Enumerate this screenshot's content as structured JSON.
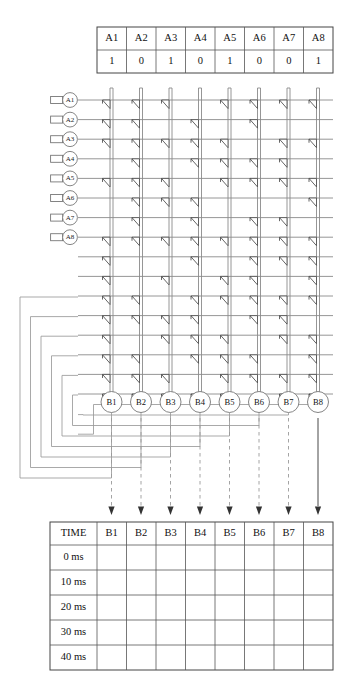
{
  "page": {
    "background_color": "#ffffff"
  },
  "input_table": {
    "name": "input-values-table",
    "headers": [
      "A1",
      "A2",
      "A3",
      "A4",
      "A5",
      "A6",
      "A7",
      "A8"
    ],
    "values": [
      "1",
      "0",
      "1",
      "0",
      "1",
      "0",
      "0",
      "1"
    ],
    "geometry": {
      "x": 97,
      "y": 27,
      "width": 236,
      "height": 46,
      "col_width": 29.5,
      "row_height": 23
    }
  },
  "input_nodes": {
    "name": "input-node-list",
    "labels": [
      "A1",
      "A2",
      "A3",
      "A4",
      "A5",
      "A6",
      "A7",
      "A8"
    ],
    "geometry": {
      "cx": 70,
      "cy_start": 100,
      "cy_step": 19.6,
      "r": 7.4,
      "tab_width": 12,
      "tab_height": 7
    }
  },
  "output_nodes": {
    "name": "output-node-list",
    "labels": [
      "B1",
      "B2",
      "B3",
      "B4",
      "B5",
      "B6",
      "B7",
      "B8"
    ],
    "geometry": {
      "cy": 402,
      "r": 10.5
    }
  },
  "columns": {
    "name": "vertical-bus-columns",
    "count": 8,
    "x_positions": [
      111.5,
      141.0,
      170.5,
      200.0,
      229.5,
      259.0,
      288.5,
      318.0
    ],
    "bus_gap": 3.0,
    "top_y": 88,
    "bottom_y": 392
  },
  "rows": {
    "name": "horizontal-signal-rows",
    "count": 16,
    "y_start": 100,
    "y_step": 19.6,
    "input_row_count": 8,
    "feedback_row_count": 8,
    "left_x": 78,
    "right_x": 333
  },
  "gate_matrix": {
    "name": "gate-connection-matrix",
    "description": "rows x columns; 1 = buffer gate present at intersection",
    "matrix": [
      [
        1,
        1,
        1,
        0,
        1,
        1,
        1,
        1
      ],
      [
        1,
        1,
        0,
        1,
        0,
        1,
        0,
        0
      ],
      [
        1,
        1,
        1,
        1,
        1,
        0,
        1,
        1
      ],
      [
        0,
        1,
        0,
        1,
        1,
        1,
        1,
        0
      ],
      [
        1,
        1,
        1,
        0,
        1,
        1,
        1,
        1
      ],
      [
        0,
        1,
        1,
        1,
        0,
        0,
        0,
        1
      ],
      [
        0,
        1,
        0,
        1,
        0,
        1,
        1,
        0
      ],
      [
        1,
        1,
        1,
        1,
        1,
        1,
        1,
        1
      ],
      [
        1,
        0,
        0,
        1,
        0,
        1,
        1,
        1
      ],
      [
        1,
        0,
        1,
        0,
        1,
        1,
        0,
        1
      ],
      [
        1,
        1,
        0,
        1,
        1,
        1,
        1,
        1
      ],
      [
        1,
        1,
        1,
        1,
        0,
        1,
        1,
        0
      ],
      [
        1,
        0,
        1,
        1,
        1,
        0,
        1,
        1
      ],
      [
        1,
        1,
        0,
        1,
        1,
        1,
        0,
        1
      ],
      [
        1,
        1,
        1,
        0,
        1,
        1,
        1,
        1
      ],
      [
        1,
        1,
        1,
        1,
        1,
        0,
        1,
        1
      ]
    ]
  },
  "feedback_loops": {
    "name": "feedback-loop-paths",
    "count": 8,
    "description": "Each output B(n) routes left and back up to feedback row n",
    "left_x_start": 20,
    "left_x_step": 10.5,
    "bottom_y_start": 478,
    "bottom_y_step": -10.5,
    "top_y_start": 297,
    "top_y_step": 19.6
  },
  "output_arrows": {
    "name": "output-arrow-group",
    "count": 8,
    "dash_top_y": 418,
    "arrow_tip_y": 515
  },
  "time_table": {
    "name": "time-results-table",
    "headers": [
      "TIME",
      "B1",
      "B2",
      "B3",
      "B4",
      "B5",
      "B6",
      "B7",
      "B8"
    ],
    "rows": [
      {
        "time": "0 ms",
        "cells": [
          "",
          "",
          "",
          "",
          "",
          "",
          "",
          ""
        ]
      },
      {
        "time": "10 ms",
        "cells": [
          "",
          "",
          "",
          "",
          "",
          "",
          "",
          ""
        ]
      },
      {
        "time": "20 ms",
        "cells": [
          "",
          "",
          "",
          "",
          "",
          "",
          "",
          ""
        ]
      },
      {
        "time": "30 ms",
        "cells": [
          "",
          "",
          "",
          "",
          "",
          "",
          "",
          ""
        ]
      },
      {
        "time": "40 ms",
        "cells": [
          "",
          "",
          "",
          "",
          "",
          "",
          "",
          ""
        ]
      }
    ],
    "geometry": {
      "x": 50,
      "y": 522,
      "width": 283,
      "header_height": 23,
      "row_height": 25,
      "time_col_width": 47
    }
  },
  "colors": {
    "wire": "#8a8a8a",
    "gate_stroke": "#4a4a4a",
    "table_border": "#555555",
    "text": "#111111",
    "arrow": "#333333",
    "feedback": "#9a9a9a"
  }
}
